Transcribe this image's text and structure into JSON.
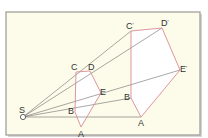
{
  "diagram": {
    "colors": {
      "background": "#fdfbe9",
      "frame": "#9a9a96",
      "frame_shadow": "#d6d6d2",
      "rays": "#6d6d6d",
      "polygon_edges": "#d98b94",
      "polygon_fill": "#ffffff",
      "label": "#333333"
    },
    "center": {
      "label": "S",
      "x": 23,
      "y": 117
    },
    "small_pentagon": {
      "vertices": [
        {
          "label": "A",
          "x": 81,
          "y": 127
        },
        {
          "label": "B",
          "x": 75,
          "y": 112
        },
        {
          "label": "C",
          "x": 76,
          "y": 72
        },
        {
          "label": "D",
          "x": 90,
          "y": 71
        },
        {
          "label": "E",
          "x": 101,
          "y": 93
        }
      ]
    },
    "large_pentagon": {
      "vertices": [
        {
          "label": "A'",
          "x": 141,
          "y": 117
        },
        {
          "label": "B'",
          "x": 131,
          "y": 98
        },
        {
          "label": "C'",
          "x": 131,
          "y": 31
        },
        {
          "label": "D'",
          "x": 162,
          "y": 28
        },
        {
          "label": "E'",
          "x": 180,
          "y": 70
        }
      ]
    },
    "labels": {
      "S": "S",
      "A": "A",
      "B": "B",
      "C": "C",
      "D": "D",
      "E": "E",
      "A2": "A",
      "B2": "B",
      "C2": "C",
      "D2": "D",
      "E2": "E",
      "prime": "'"
    }
  }
}
